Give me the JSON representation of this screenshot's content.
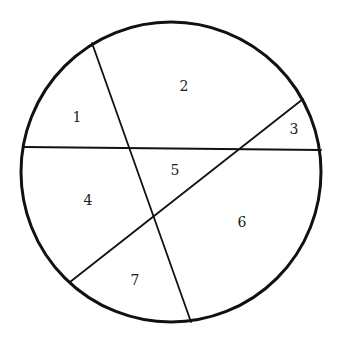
{
  "diagram": {
    "type": "circle-partition",
    "stroke_color": "#111111",
    "background": "#ffffff",
    "circle": {
      "cx": 171,
      "cy": 172,
      "r": 150,
      "stroke_width": 3
    },
    "chords": [
      {
        "name": "horizontal-chord",
        "x1": 24,
        "y1": 147,
        "x2": 321,
        "y2": 150,
        "stroke_width": 1.8
      },
      {
        "name": "steep-chord",
        "x1": 92,
        "y1": 43,
        "x2": 191,
        "y2": 322,
        "stroke_width": 1.8
      },
      {
        "name": "diagonal-chord",
        "x1": 70,
        "y1": 282,
        "x2": 303,
        "y2": 99,
        "stroke_width": 1.8
      }
    ],
    "regions": [
      {
        "label": "1",
        "x": 77,
        "y": 118
      },
      {
        "label": "2",
        "x": 184,
        "y": 87
      },
      {
        "label": "3",
        "x": 294,
        "y": 130
      },
      {
        "label": "4",
        "x": 88,
        "y": 201
      },
      {
        "label": "5",
        "x": 175,
        "y": 171
      },
      {
        "label": "6",
        "x": 242,
        "y": 223
      },
      {
        "label": "7",
        "x": 135,
        "y": 281
      }
    ]
  }
}
